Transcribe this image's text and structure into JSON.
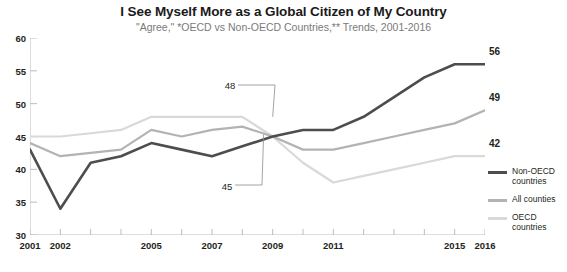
{
  "header": {
    "title": "I See Myself More as a Global Citizen of My Country",
    "subtitle": "\"Agree,\" *OECD vs Non-OECD Countries,** Trends, 2001-2016"
  },
  "legend": {
    "items": [
      {
        "label": "Non-OECD countries",
        "color": "#4d4d4d"
      },
      {
        "label": "All counties",
        "color": "#b3b3b3"
      },
      {
        "label": "OECD countries",
        "color": "#d9d9d9"
      }
    ]
  },
  "chart_data": {
    "type": "line",
    "title": "I See Myself More as a Global Citizen of My Country",
    "subtitle": "\"Agree,\" *OECD vs Non-OECD Countries,** Trends, 2001-2016",
    "xlabel": "",
    "ylabel": "",
    "ylim": [
      30,
      60
    ],
    "yticks": [
      30,
      35,
      40,
      45,
      50,
      55,
      60
    ],
    "grid": false,
    "legend_position": "right",
    "x": [
      2001,
      2002,
      2003,
      2004,
      2005,
      2006,
      2007,
      2008,
      2009,
      2010,
      2011,
      2012,
      2013,
      2014,
      2015,
      2016
    ],
    "xtick_labels": [
      "2001",
      "2002",
      "2005",
      "2007",
      "2009",
      "2011",
      "2015",
      "2016"
    ],
    "xtick_values": [
      2001,
      2002,
      2005,
      2007,
      2009,
      2011,
      2015,
      2016
    ],
    "series": [
      {
        "name": "Non-OECD countries",
        "color": "#4d4d4d",
        "values": [
          43,
          34,
          41,
          42,
          44,
          43,
          42,
          43.5,
          45,
          46,
          46,
          48,
          51,
          54,
          56,
          56
        ],
        "end_label": "56"
      },
      {
        "name": "All counties",
        "color": "#b3b3b3",
        "values": [
          44,
          42,
          42.5,
          43,
          46,
          45,
          46,
          46.5,
          45,
          43,
          43,
          44,
          45,
          46,
          47,
          49
        ],
        "end_label": "49"
      },
      {
        "name": "OECD countries",
        "color": "#d9d9d9",
        "values": [
          45,
          45,
          45.5,
          46,
          48,
          48,
          48,
          48,
          45,
          41,
          38,
          39,
          40,
          41,
          42,
          42
        ],
        "end_label": "42"
      }
    ],
    "annotations": [
      {
        "text": "48",
        "value": 48,
        "year": 2009,
        "series": "OECD countries"
      },
      {
        "text": "45",
        "value": 45,
        "year": 2009,
        "series": "Non-OECD countries"
      }
    ]
  }
}
